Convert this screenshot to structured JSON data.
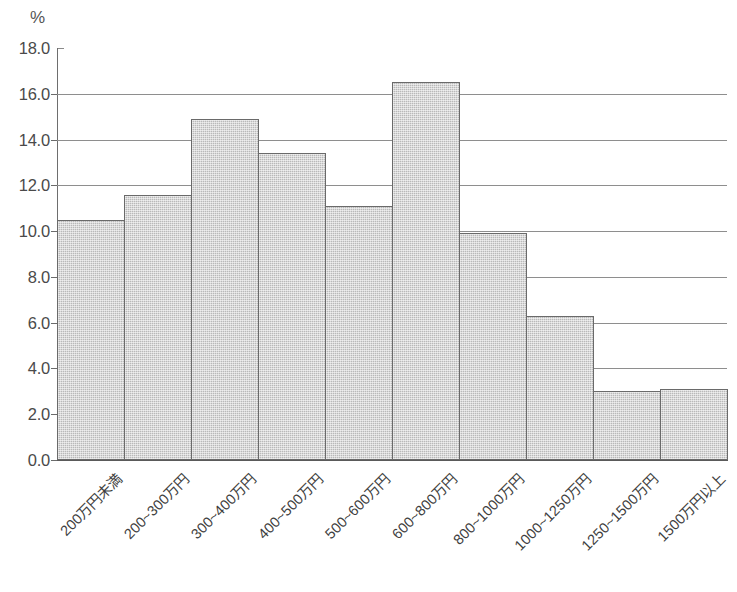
{
  "chart_data": {
    "type": "bar",
    "title": "",
    "subtitle": "",
    "xlabel": "",
    "ylabel": "",
    "unit_label": "%",
    "ylim": [
      0.0,
      18.0
    ],
    "yticks": [
      "0.0",
      "2.0",
      "4.0",
      "6.0",
      "8.0",
      "10.0",
      "12.0",
      "14.0",
      "16.0",
      "18.0"
    ],
    "ytick_values": [
      0.0,
      2.0,
      4.0,
      6.0,
      8.0,
      10.0,
      12.0,
      14.0,
      16.0,
      18.0
    ],
    "gridlines": [
      2.0,
      4.0,
      6.0,
      8.0,
      10.0,
      12.0,
      14.0,
      16.0
    ],
    "grid": true,
    "legend": "none",
    "categories": [
      "200万円未満",
      "200~300万円",
      "300~400万円",
      "400~500万円",
      "500~600万円",
      "600~800万円",
      "800~1000万円",
      "1000~1250万円",
      "1250~1500万円",
      "1500万円以上"
    ],
    "values": [
      10.5,
      11.6,
      14.9,
      13.4,
      11.1,
      16.5,
      9.9,
      6.3,
      3.0,
      3.1
    ],
    "bar_fill_color": "#b9b9b9",
    "bar_border_color": "#6a6a6a",
    "grid_color": "#8e8e8e",
    "axis_color": "#5a5a5a",
    "text_color": "#3f3f3f"
  }
}
